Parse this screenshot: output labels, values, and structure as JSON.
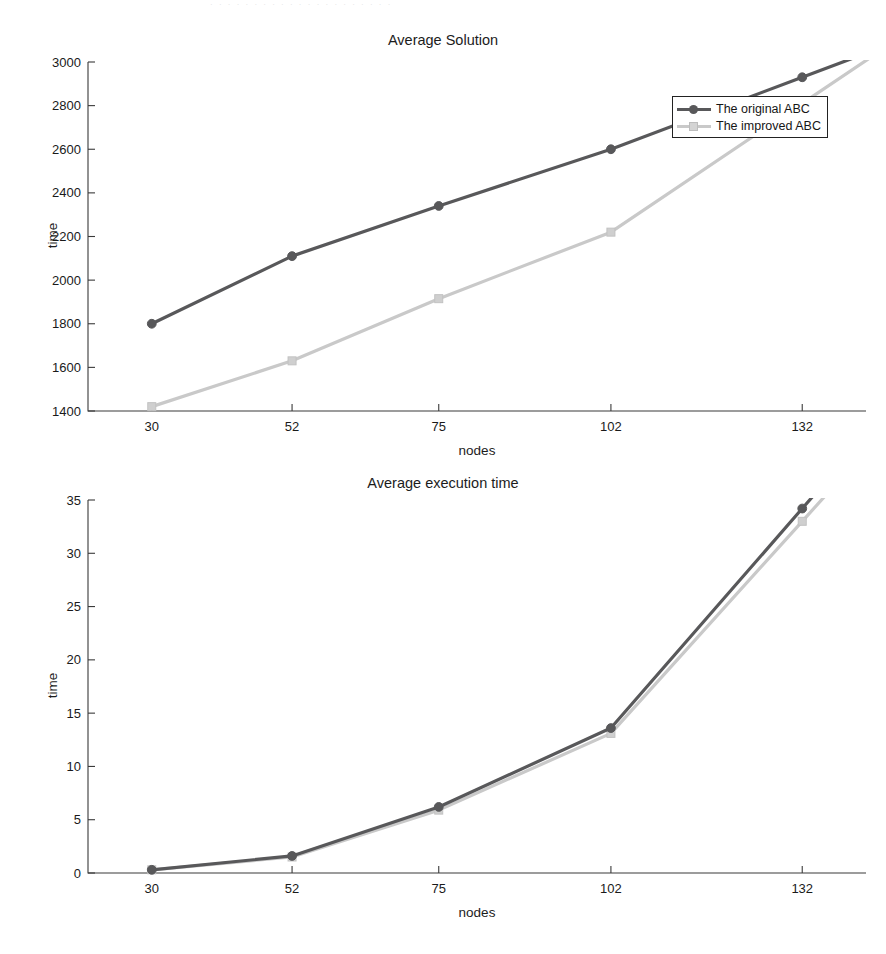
{
  "page": {
    "top_artifact_text": "· · · · · · ·   · · ·   · · · · ·   · · · · · ·"
  },
  "legend": {
    "series": [
      {
        "label": "The original ABC",
        "color": "#58585a",
        "marker": "circle"
      },
      {
        "label": "The improved ABC",
        "color": "#c9c9c9",
        "marker": "square"
      }
    ]
  },
  "chart_data": [
    {
      "type": "line",
      "title": "Average Solution",
      "xlabel": "nodes",
      "ylabel": "time",
      "categories": [
        "30",
        "52",
        "75",
        "102",
        "132"
      ],
      "x": [
        30,
        52,
        75,
        102,
        132
      ],
      "xtick_labels": [
        "30",
        "52",
        "75",
        "102",
        "132"
      ],
      "ytick_labels": [
        "1400",
        "1600",
        "1800",
        "2000",
        "2200",
        "2400",
        "2600",
        "2800",
        "3000"
      ],
      "ylim": [
        1400,
        3000
      ],
      "xlim": [
        20,
        142
      ],
      "grid": false,
      "legend_position": "top-right",
      "series": [
        {
          "name": "The original ABC",
          "color": "#58585a",
          "marker": "circle",
          "values": [
            1800,
            2110,
            2340,
            2600,
            2930
          ]
        },
        {
          "name": "The improved ABC",
          "color": "#c9c9c9",
          "marker": "square",
          "values": [
            1420,
            1630,
            1915,
            2220,
            2810
          ]
        }
      ]
    },
    {
      "type": "line",
      "title": "Average execution time",
      "xlabel": "nodes",
      "ylabel": "time",
      "categories": [
        "30",
        "52",
        "75",
        "102",
        "132"
      ],
      "x": [
        30,
        52,
        75,
        102,
        132
      ],
      "xtick_labels": [
        "30",
        "52",
        "75",
        "102",
        "132"
      ],
      "ytick_labels": [
        "0",
        "5",
        "10",
        "15",
        "20",
        "25",
        "30",
        "35"
      ],
      "ylim": [
        0,
        35
      ],
      "xlim": [
        20,
        142
      ],
      "grid": false,
      "legend_position": "top-right",
      "series": [
        {
          "name": "The original ABC",
          "color": "#58585a",
          "marker": "circle",
          "values": [
            0.3,
            1.6,
            6.2,
            13.6,
            34.2
          ]
        },
        {
          "name": "The improved ABC",
          "color": "#c9c9c9",
          "marker": "square",
          "values": [
            0.3,
            1.5,
            5.9,
            13.1,
            33.0
          ]
        }
      ]
    }
  ]
}
